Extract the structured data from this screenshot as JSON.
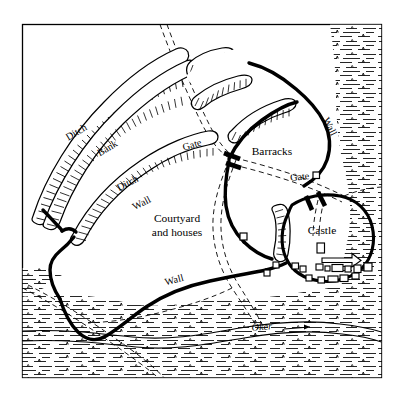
{
  "map": {
    "title": "Plan of fortified town with castle",
    "style": "monochrome line engraving, hachured earthworks",
    "frame": {
      "stroke": "#000000",
      "fill": "#ffffff"
    },
    "ink_color": "#000000",
    "paper_color": "#ffffff",
    "labels": [
      {
        "id": "ditch-outer",
        "text": "Ditch",
        "x": 78,
        "y": 135,
        "rotate": -31,
        "size": "lbl-md"
      },
      {
        "id": "bank",
        "text": "Bank",
        "x": 109,
        "y": 151,
        "rotate": -31,
        "size": "lbl-md"
      },
      {
        "id": "ditch-inner",
        "text": "Ditch",
        "x": 129,
        "y": 186,
        "rotate": -27,
        "size": "lbl-md"
      },
      {
        "id": "wall-west",
        "text": "Wall",
        "x": 143,
        "y": 206,
        "rotate": -27,
        "size": "lbl-md"
      },
      {
        "id": "gate-north",
        "text": "Gate",
        "x": 193,
        "y": 148,
        "rotate": -17,
        "size": "lbl-md"
      },
      {
        "id": "barracks",
        "text": "Barracks",
        "x": 272,
        "y": 155,
        "rotate": 0,
        "size": "lbl-lg"
      },
      {
        "id": "wall-northeast",
        "text": "Wall",
        "x": 327,
        "y": 128,
        "rotate": 64,
        "size": "lbl-md"
      },
      {
        "id": "gate-east",
        "text": "Gate",
        "x": 300,
        "y": 180,
        "rotate": -6,
        "size": "lbl-md"
      },
      {
        "id": "courtyard",
        "text": "Courtyard",
        "x": 177,
        "y": 222,
        "rotate": 0,
        "size": "lbl-lg"
      },
      {
        "id": "courtyard-2",
        "text": "and houses",
        "x": 177,
        "y": 236,
        "rotate": 0,
        "size": "lbl-lg"
      },
      {
        "id": "castle",
        "text": "Castle",
        "x": 322,
        "y": 234,
        "rotate": 0,
        "size": "lbl-lg"
      },
      {
        "id": "wall-south",
        "text": "Wall",
        "x": 175,
        "y": 283,
        "rotate": -15,
        "size": "lbl-md"
      },
      {
        "id": "river",
        "text": "Oker",
        "x": 262,
        "y": 330,
        "rotate": -4,
        "size": "lbl-river"
      }
    ],
    "features": {
      "earthwork_banks": 5,
      "gates": 2,
      "castle_buildings": 14,
      "courtyard_buildings": 2,
      "river_name": "Oker",
      "roads": "dashed double lines",
      "marsh": "horizontal hatch with tufts"
    }
  }
}
